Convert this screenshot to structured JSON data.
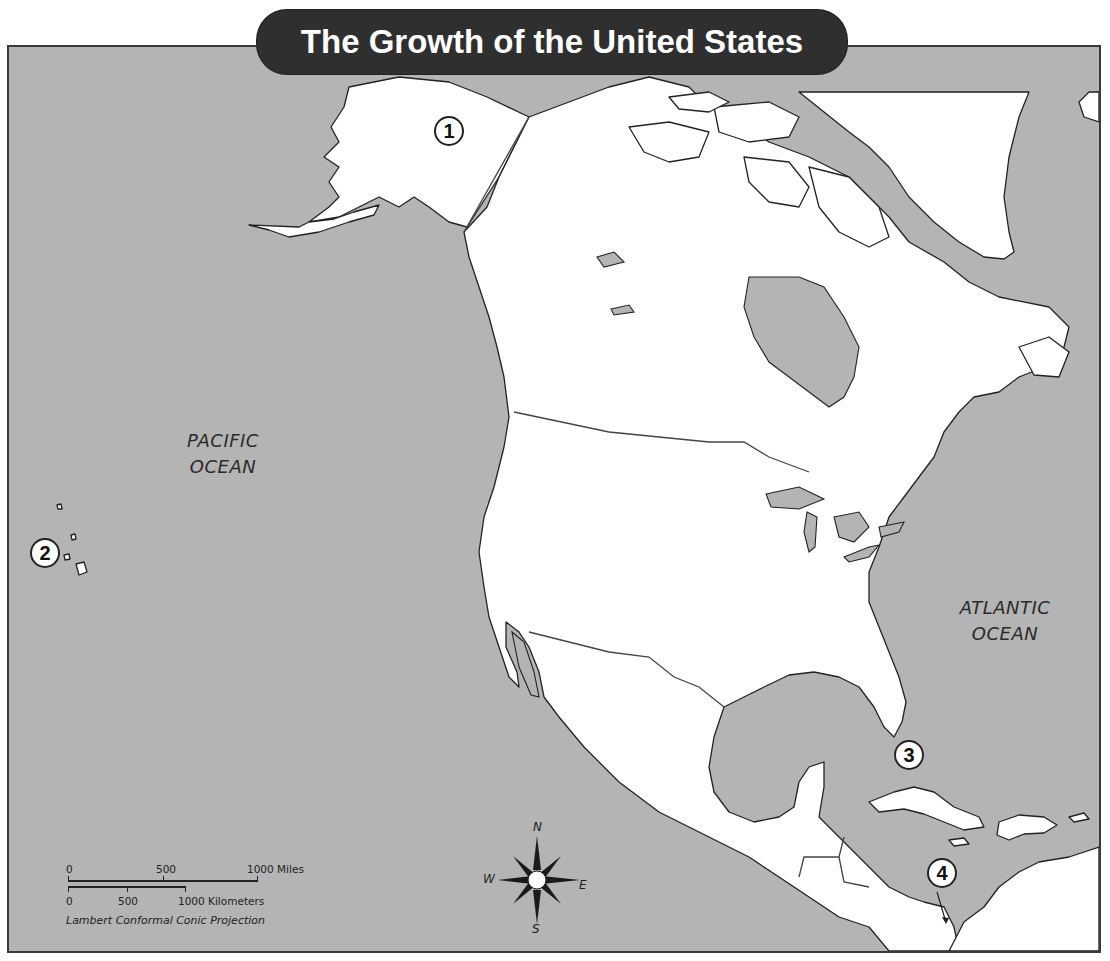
{
  "map": {
    "title": "The Growth of the United States",
    "colors": {
      "ocean": "#b4b4b4",
      "land": "#ffffff",
      "title_bg": "#2f2f2f",
      "coastline": "#222222"
    },
    "ocean_labels": [
      {
        "line1": "PACIFIC",
        "line2": "OCEAN"
      },
      {
        "line1": "ATLANTIC",
        "line2": "OCEAN"
      }
    ],
    "markers": [
      {
        "number": "1",
        "region": "Alaska"
      },
      {
        "number": "2",
        "region": "Hawaii"
      },
      {
        "number": "3",
        "region": "Cuba"
      },
      {
        "number": "4",
        "region": "Panama"
      }
    ],
    "scale_bar": {
      "miles_ticks": [
        "0",
        "500",
        "1000 Miles"
      ],
      "km_ticks": [
        "0",
        "500",
        "1000 Kilometers"
      ],
      "projection": "Lambert Conformal Conic Projection"
    },
    "compass": {
      "n": "N",
      "s": "S",
      "e": "E",
      "w": "W"
    }
  }
}
